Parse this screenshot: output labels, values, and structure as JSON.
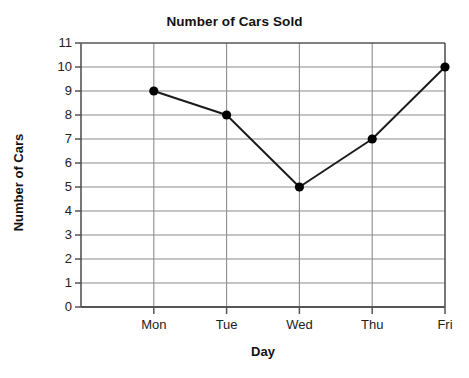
{
  "chart_data": {
    "type": "line",
    "title": "Number of Cars Sold",
    "xlabel": "Day",
    "ylabel": "Number of Cars",
    "categories": [
      "Mon",
      "Tue",
      "Wed",
      "Thu",
      "Fri"
    ],
    "values": [
      9,
      8,
      5,
      7,
      10
    ],
    "series": [
      {
        "name": "Number of Cars",
        "values": [
          9,
          8,
          5,
          7,
          10
        ]
      }
    ],
    "ylim": [
      0,
      11
    ],
    "y_ticks": [
      0,
      1,
      2,
      3,
      4,
      5,
      6,
      7,
      8,
      9,
      10,
      11
    ],
    "y_tick_labels": [
      "0",
      "1",
      "2",
      "3",
      "4",
      "5",
      "6",
      "7",
      "8",
      "9",
      "10",
      "11"
    ],
    "x_tick_labels": [
      "Mon",
      "Tue",
      "Wed",
      "Thu",
      "Fri"
    ],
    "grid": "horizontal-and-vertical",
    "legend": "none",
    "marker": "filled-circle",
    "line_color": "#1a1a1a",
    "marker_color": "#000000",
    "grid_color": "#8c8c8c",
    "axis_color": "#444444",
    "background_color": "#ffffff",
    "annotations": []
  }
}
